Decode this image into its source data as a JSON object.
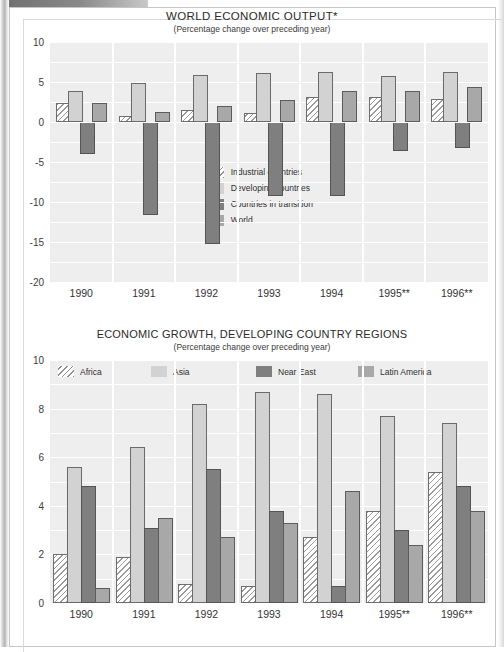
{
  "document": {
    "kind": "scanned-report-page"
  },
  "chart_data": [
    {
      "id": "world-economic-output",
      "type": "bar",
      "title": "WORLD ECONOMIC OUTPUT*",
      "subtitle": "(Percentage change over preceding year)",
      "xlabel": "",
      "ylabel": "",
      "ylim": [
        -20,
        10
      ],
      "yticks": [
        10,
        5,
        0,
        -5,
        -10,
        -15,
        -20
      ],
      "grid": true,
      "legend_position": "inside-center",
      "categories": [
        "1990",
        "1991",
        "1992",
        "1993",
        "1994",
        "1995**",
        "1996**"
      ],
      "series": [
        {
          "name": "Industrial countries",
          "swatch": "hatch",
          "color": "#ffffff",
          "values": [
            2.4,
            0.8,
            1.5,
            1.1,
            3.1,
            3.1,
            2.9
          ]
        },
        {
          "name": "Developing countries",
          "swatch": "light",
          "color": "#d2d2d2",
          "values": [
            3.9,
            4.9,
            5.9,
            6.1,
            6.3,
            5.7,
            6.2
          ]
        },
        {
          "name": "Countries in transition",
          "swatch": "dark",
          "color": "#7f7f7f",
          "values": [
            -4.0,
            -11.6,
            -15.2,
            -9.2,
            -9.3,
            -3.6,
            -3.3
          ]
        },
        {
          "name": "World",
          "swatch": "mid",
          "color": "#a8a8a8",
          "values": [
            2.4,
            1.3,
            2.0,
            2.7,
            3.9,
            3.9,
            4.4
          ]
        }
      ]
    },
    {
      "id": "economic-growth-developing-country-regions",
      "type": "bar",
      "title": "ECONOMIC GROWTH, DEVELOPING COUNTRY REGIONS",
      "subtitle": "(Percentage change over preceding year)",
      "xlabel": "",
      "ylabel": "",
      "ylim": [
        0,
        10
      ],
      "yticks": [
        10,
        8,
        6,
        4,
        2,
        0
      ],
      "grid": true,
      "legend_position": "top-inside",
      "categories": [
        "1990",
        "1991",
        "1992",
        "1993",
        "1994",
        "1995**",
        "1996**"
      ],
      "series": [
        {
          "name": "Africa",
          "swatch": "hatch",
          "color": "#ffffff",
          "values": [
            2.0,
            1.9,
            0.8,
            0.7,
            2.7,
            3.8,
            5.4
          ]
        },
        {
          "name": "Asia",
          "swatch": "light",
          "color": "#d2d2d2",
          "values": [
            5.6,
            6.4,
            8.2,
            8.7,
            8.6,
            7.7,
            7.4
          ]
        },
        {
          "name": "Near East",
          "swatch": "dark",
          "color": "#7f7f7f",
          "values": [
            4.8,
            3.1,
            5.5,
            3.8,
            0.7,
            3.0,
            4.8
          ]
        },
        {
          "name": "Latin America",
          "swatch": "mid",
          "color": "#a8a8a8",
          "values": [
            0.6,
            3.5,
            2.7,
            3.3,
            4.6,
            2.4,
            3.8
          ]
        }
      ]
    }
  ]
}
